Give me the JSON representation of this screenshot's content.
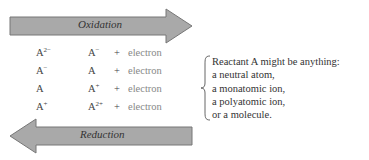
{
  "oxidation_arrow": {
    "label": "Oxidation",
    "direction": "right",
    "fill": "#a9a9a9",
    "stroke": "#777777"
  },
  "reduction_arrow": {
    "label": "Reduction",
    "direction": "left",
    "fill": "#a9a9a9",
    "stroke": "#777777"
  },
  "reactions": [
    {
      "reactant": "A",
      "reactant_charge": "2−",
      "product": "A",
      "product_charge": "−",
      "plus": "+",
      "electron": "electron"
    },
    {
      "reactant": "A",
      "reactant_charge": "−",
      "product": "A",
      "product_charge": "",
      "plus": "+",
      "electron": "electron"
    },
    {
      "reactant": "A",
      "reactant_charge": "",
      "product": "A",
      "product_charge": "+",
      "plus": "+",
      "electron": "electron"
    },
    {
      "reactant": "A",
      "reactant_charge": "+",
      "product": "A",
      "product_charge": "2+",
      "plus": "+",
      "electron": "electron"
    }
  ],
  "note": {
    "lines": [
      "Reactant A might be anything:",
      "a neutral atom,",
      "a monatomic ion,",
      "a polyatomic ion,",
      "or a molecule."
    ]
  }
}
